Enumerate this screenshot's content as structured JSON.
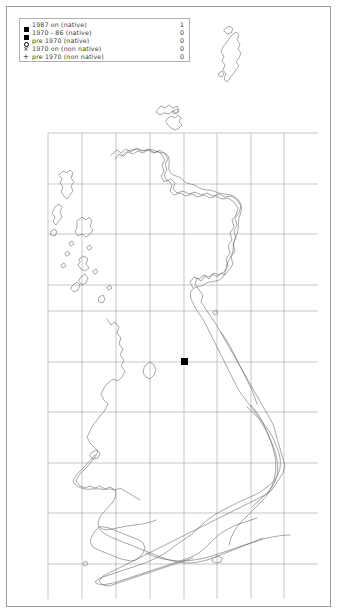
{
  "map": {
    "title": "UK and Ireland species distribution map",
    "background_color": "#ffffff",
    "frame_color": "#9a9a9a",
    "coastline_color": "#5d5d5d",
    "grid_color": "#8c8c8c",
    "marker_color": "#000000"
  },
  "legend": {
    "border_color": "#b0b0b0",
    "rows": [
      {
        "symbol": "filled-square",
        "label": "1987 on (native)",
        "count": "1"
      },
      {
        "symbol": "filled-square",
        "label": "1970 - 86 (native)",
        "count": "0"
      },
      {
        "symbol": "open-circle",
        "label": "pre 1970 (native)",
        "count": "0"
      },
      {
        "symbol": "cross-x",
        "label": "1970 on (non native)",
        "count": "0"
      },
      {
        "symbol": "plus",
        "label": "pre 1970 (non native)",
        "count": "0"
      }
    ]
  },
  "records": [
    {
      "symbol": "filled-square",
      "class": "1987 on (native)",
      "x": 184,
      "y": 361
    }
  ],
  "grid": {
    "vertical_x": [
      48,
      82,
      116,
      150,
      184,
      217,
      251,
      284
    ],
    "horizontal_y": [
      133,
      184,
      234,
      285,
      311,
      362,
      412,
      463,
      513,
      564
    ]
  }
}
